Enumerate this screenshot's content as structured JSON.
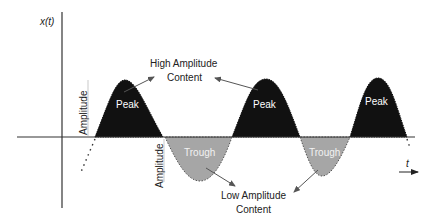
{
  "diagram": {
    "axis": {
      "y_label": "x(t)",
      "x_label": "t"
    },
    "peaks": [
      {
        "label": "Peak"
      },
      {
        "label": "Peak"
      },
      {
        "label": "Peak"
      }
    ],
    "troughs": [
      {
        "label": "Trough"
      },
      {
        "label": "Trough"
      }
    ],
    "amplitude_markers": [
      {
        "label": "Amplitude"
      },
      {
        "label": "Amplitude"
      }
    ],
    "annotations": {
      "high": {
        "line1": "High Amplitude",
        "line2": "Content"
      },
      "low": {
        "line1": "Low Amplitude",
        "line2": "Content"
      }
    },
    "colors": {
      "peak_fill": "#111111",
      "trough_fill": "#a6a6a6",
      "axis": "#333333",
      "arrow": "#555555"
    }
  }
}
